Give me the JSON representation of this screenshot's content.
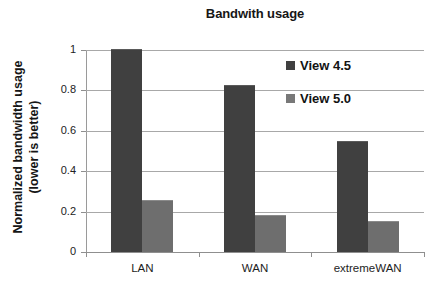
{
  "chart_data": {
    "type": "bar",
    "title": "Bandwith usage",
    "xlabel": "",
    "ylabel": "Normalized bandwidth usage (lower is better)",
    "ylabel_lines": [
      "Normalized bandwidth usage",
      "(lower is better)"
    ],
    "categories": [
      "LAN",
      "WAN",
      "extremeWAN"
    ],
    "series": [
      {
        "name": "View 4.5",
        "values": [
          1.0,
          0.82,
          0.545
        ],
        "color": "#404040"
      },
      {
        "name": "View 5.0",
        "values": [
          0.255,
          0.18,
          0.15
        ],
        "color": "#6e6e6e"
      }
    ],
    "ylim": [
      0,
      1
    ],
    "yticks": [
      0,
      0.2,
      0.4,
      0.6,
      0.8,
      1
    ],
    "ytick_labels": [
      "0",
      "0.2",
      "0.4",
      "0.6",
      "0.8",
      "1"
    ],
    "grid": true,
    "legend_position": "upper-right-inside"
  }
}
